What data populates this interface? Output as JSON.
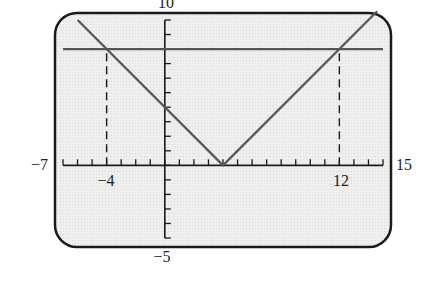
{
  "chart_data": {
    "type": "line",
    "title": "",
    "xlabel": "",
    "ylabel": "",
    "xlim": [
      -7,
      15
    ],
    "ylim": [
      -5,
      10
    ],
    "x_tick_step": 1,
    "y_tick_step": 1,
    "grid": false,
    "legend": null,
    "tick_labels": {
      "x_min": "−7",
      "x_max": "15",
      "y_max": "10",
      "y_min": "−5",
      "annotated_x": [
        "−4",
        "12"
      ]
    },
    "series": [
      {
        "name": "y = |x - 4|",
        "x": [
          -6,
          4,
          14.6
        ],
        "y": [
          10,
          0,
          10.6
        ],
        "color": "#555555"
      },
      {
        "name": "y = 8",
        "x": [
          -7,
          15
        ],
        "y": [
          8,
          8
        ],
        "color": "#555555"
      }
    ],
    "annotations": [
      {
        "type": "dashed-vertical",
        "x": -4,
        "from_y": 0,
        "to_y": 8,
        "label": "−4"
      },
      {
        "type": "dashed-vertical",
        "x": 12,
        "from_y": 0,
        "to_y": 8,
        "label": "12"
      }
    ],
    "intersections": [
      [
        -4,
        8
      ],
      [
        12,
        8
      ]
    ],
    "vertex": [
      4,
      0
    ],
    "screen_background": "#ececec",
    "frame_color": "#1a1a1a"
  }
}
